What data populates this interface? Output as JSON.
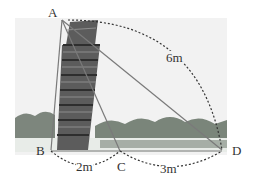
{
  "diagram": {
    "points": {
      "A": {
        "label": "A",
        "x": 62,
        "y": 20
      },
      "B": {
        "label": "B",
        "x": 51,
        "y": 150
      },
      "C": {
        "label": "C",
        "x": 120,
        "y": 151
      },
      "D": {
        "label": "D",
        "x": 222,
        "y": 151
      }
    },
    "measurements": {
      "AD": "6m",
      "BC": "2m",
      "CD": "3m"
    },
    "colors": {
      "line": "#777777",
      "dash": "#333333",
      "tower": "#5a5a5a",
      "trees": "#6e7a6e"
    }
  }
}
